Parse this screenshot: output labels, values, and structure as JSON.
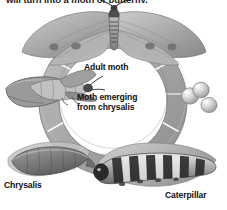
{
  "figure": {
    "title_caption": "will turn into a moth or butterfly.",
    "style": "grayscale-engraving",
    "background_color": "#ffffff",
    "ring_color": "#a9a9a9",
    "ring_shadow_color": "#8b8b8b",
    "ring_outline_color": "#5c5c5c",
    "text_color": "#111111"
  },
  "labels": {
    "adult_moth": "Adult moth",
    "moth_emerging": "Moth emerging from chrysalis",
    "chrysalis": "Chrysalis",
    "caterpillar": "Caterpillar"
  },
  "stages": [
    {
      "name": "adult-moth",
      "label": "Adult moth",
      "position": "top"
    },
    {
      "name": "eggs",
      "label": "",
      "position": "right",
      "count": 3
    },
    {
      "name": "caterpillar",
      "label": "Caterpillar",
      "position": "bottom-right"
    },
    {
      "name": "chrysalis",
      "label": "Chrysalis",
      "position": "bottom-left"
    },
    {
      "name": "moth-emerging-from-chrysalis",
      "label": "Moth emerging from chrysalis",
      "position": "left"
    }
  ],
  "ring": {
    "segment_count": 12,
    "direction": "clockwise",
    "divider_color": "#ffffff"
  }
}
